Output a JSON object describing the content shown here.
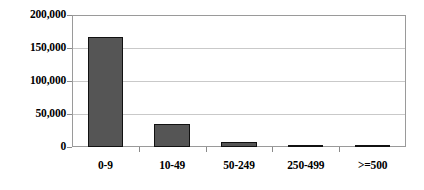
{
  "chart_data": {
    "type": "bar",
    "title": "",
    "subtitle": "",
    "xlabel": "",
    "ylabel": "",
    "categories": [
      "0-9",
      "10-49",
      "50-249",
      "250-499",
      ">=500"
    ],
    "values": [
      167000,
      35000,
      8000,
      2500,
      2000
    ],
    "series": [
      {
        "name": "",
        "values": [
          167000,
          35000,
          8000,
          2500,
          2000
        ]
      }
    ],
    "ylim": [
      0,
      200000
    ],
    "ytick_values": [
      0,
      50000,
      100000,
      150000,
      200000
    ],
    "ytick_labels": [
      "0",
      "50,000",
      "100,000",
      "150,000",
      "200,000"
    ],
    "grid": true,
    "grid_axis": "y",
    "legend": false,
    "legend_position": "none",
    "annotations": [],
    "colors": {
      "bar_fill": "#555555",
      "bar_border": "#111111",
      "gridline": "#c9c9c9",
      "frame": "#9a9a9a",
      "background": "#ffffff",
      "text": "#000000"
    }
  }
}
